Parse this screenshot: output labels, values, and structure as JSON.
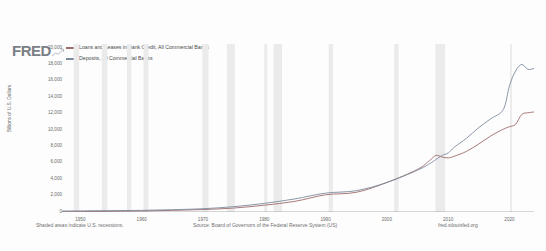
{
  "brand": {
    "logo_text": "FRED",
    "logo_color": "#7a7f86",
    "glyph_icon": "mini-line-chart-icon"
  },
  "legend": {
    "position": "top-left",
    "items": [
      {
        "label": "Loans and Leases in Bank Credit, All Commercial Banks",
        "color": "#9e6b6b"
      },
      {
        "label": "Deposits, All Commercial Banks",
        "color": "#7d8b9e"
      }
    ]
  },
  "footer": {
    "left": "Shaded areas indicate U.S. recessions.",
    "middle": "Source: Board of Governors of the Federal Reserve System (US)",
    "right": "fred.stlouisfed.org"
  },
  "chart_data": {
    "type": "line",
    "title": "",
    "xlabel": "",
    "ylabel": "Billions of U.S. Dollars",
    "xlim": [
      1947,
      2024
    ],
    "ylim": [
      0,
      20000
    ],
    "grid": false,
    "legend_position": "top-left",
    "xticks": [
      "1950",
      "1960",
      "1970",
      "1980",
      "1990",
      "2000",
      "2010",
      "2020"
    ],
    "xtick_values": [
      1950,
      1960,
      1970,
      1980,
      1990,
      2000,
      2010,
      2020
    ],
    "yticks": [
      "0",
      "2,000",
      "4,000",
      "6,000",
      "8,000",
      "10,000",
      "12,000",
      "14,000",
      "16,000",
      "18,000",
      "20,000"
    ],
    "ytick_values": [
      0,
      2000,
      4000,
      6000,
      8000,
      10000,
      12000,
      14000,
      16000,
      18000,
      20000
    ],
    "x": [
      1947,
      1950,
      1955,
      1960,
      1965,
      1970,
      1975,
      1980,
      1985,
      1990,
      1995,
      2000,
      2005,
      2007,
      2008,
      2009,
      2010,
      2011,
      2013,
      2015,
      2017,
      2019,
      2020,
      2021,
      2022,
      2023,
      2024
    ],
    "series": [
      {
        "name": "Loans and Leases in Bank Credit, All Commercial Banks",
        "color": "#9e6b6b",
        "values": [
          38,
          52,
          82,
          118,
          200,
          300,
          480,
          830,
          1300,
          2100,
          2400,
          3600,
          5200,
          6300,
          6900,
          6700,
          6600,
          6800,
          7400,
          8300,
          9300,
          10100,
          10400,
          10700,
          11900,
          12100,
          12200
        ]
      },
      {
        "name": "Deposits, All Commercial Banks",
        "color": "#7d8b9e",
        "values": [
          120,
          140,
          170,
          200,
          280,
          400,
          650,
          1050,
          1600,
          2300,
          2600,
          3600,
          5100,
          5900,
          6400,
          6900,
          7200,
          7900,
          9000,
          10300,
          11400,
          12500,
          15400,
          17200,
          18000,
          17400,
          17500
        ]
      }
    ],
    "recession_bands": [
      [
        1948.9,
        1949.8
      ],
      [
        1953.5,
        1954.4
      ],
      [
        1957.6,
        1958.3
      ],
      [
        1960.3,
        1961.1
      ],
      [
        1969.9,
        1970.9
      ],
      [
        1973.9,
        1975.2
      ],
      [
        1980.0,
        1980.5
      ],
      [
        1981.5,
        1982.9
      ],
      [
        1990.5,
        1991.2
      ],
      [
        2001.2,
        2001.9
      ],
      [
        2007.9,
        2009.5
      ],
      [
        2020.1,
        2020.4
      ]
    ],
    "recession_band_color": "#ebebeb"
  }
}
